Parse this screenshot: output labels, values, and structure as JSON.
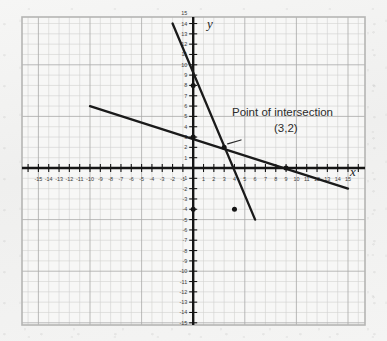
{
  "figure": {
    "kind": "graph-paper-line-plot",
    "background_color": "#f2f2f1",
    "grid_border_color": "#b9b9b7",
    "minor_grid_color": "#cfcfcd",
    "major_grid_color": "#a8a8a6",
    "axis_color": "#151515",
    "line_color": "#1a1a1a",
    "text_color": "#2b2b2b"
  },
  "axes": {
    "x_name": "x",
    "y_name": "y",
    "x_tick_labels": [
      "-15",
      "-14",
      "-13",
      "-12",
      "-11",
      "-10",
      "-9",
      "-8",
      "-7",
      "-6",
      "-5",
      "-4",
      "-3",
      "-2",
      "-1",
      "1",
      "2",
      "3",
      "4",
      "5",
      "6",
      "7",
      "8",
      "9",
      "10",
      "11",
      "12",
      "13",
      "14",
      "15"
    ],
    "y_tick_labels": [
      "15",
      "14",
      "13",
      "12",
      "11",
      "10",
      "9",
      "8",
      "7",
      "6",
      "5",
      "4",
      "3",
      "2",
      "1",
      "-1",
      "-2",
      "-3",
      "-4",
      "-5",
      "-6",
      "-7",
      "-8",
      "-9",
      "-10",
      "-11",
      "-12",
      "-13",
      "-14",
      "-15"
    ],
    "x_min": -16,
    "x_max": 16,
    "y_min": -16,
    "y_max": 16,
    "grid": true
  },
  "annotation": {
    "title": "Point of intersection",
    "coords": "(3,2)"
  },
  "chart_data": {
    "type": "line",
    "title": "",
    "xlabel": "x",
    "ylabel": "y",
    "xlim": [
      -16,
      16
    ],
    "ylim": [
      -16,
      16
    ],
    "grid": true,
    "legend": "none",
    "series": [
      {
        "name": "steep-line",
        "slope": -3,
        "y_intercept": 8,
        "x_intercept": 2.667,
        "points": [
          [
            -2,
            14
          ],
          [
            6,
            -5
          ]
        ]
      },
      {
        "name": "shallow-line",
        "slope": -0.3333,
        "y_intercept": 3,
        "x_intercept": 9,
        "points": [
          [
            -10,
            6
          ],
          [
            15,
            -2
          ]
        ]
      }
    ],
    "marked_points": [
      {
        "label": "",
        "x": 0,
        "y": 8
      },
      {
        "label": "",
        "x": 0,
        "y": 3
      },
      {
        "label": "",
        "x": 0,
        "y": -4
      },
      {
        "label": "(3,2)",
        "x": 3,
        "y": 2
      },
      {
        "label": "",
        "x": 4,
        "y": -4
      },
      {
        "label": "",
        "x": 9,
        "y": 0
      }
    ],
    "intersection": {
      "x": 3,
      "y": 2,
      "label": "(3,2)"
    }
  }
}
